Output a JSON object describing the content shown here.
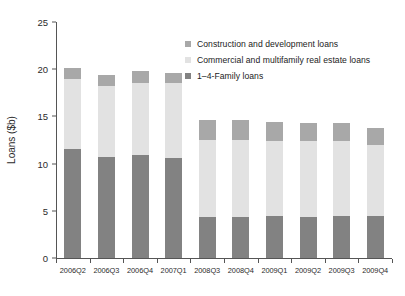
{
  "chart_data": {
    "type": "bar",
    "subtype": "stacked-vertical",
    "title": "",
    "xlabel": "",
    "ylabel": "Loans ($b)",
    "ylim": [
      0,
      25
    ],
    "yticks": [
      0,
      5,
      10,
      15,
      20,
      25
    ],
    "ytick_labels": [
      "0",
      "5",
      "10",
      "15",
      "20",
      "25"
    ],
    "grid": false,
    "legend_position": "upper-right-inside",
    "categories": [
      "2006Q2",
      "2006Q3",
      "2006Q4",
      "2007Q1",
      "2008Q3",
      "2008Q4",
      "2009Q1",
      "2009Q2",
      "2009Q3",
      "2009Q4"
    ],
    "series": [
      {
        "name": "1–4-Family loans",
        "color": "#828282",
        "values": [
          11.5,
          10.7,
          10.9,
          10.6,
          4.3,
          4.3,
          4.4,
          4.3,
          4.4,
          4.4
        ]
      },
      {
        "name": "Commercial and multifamily real estate loans",
        "color": "#e2e2e2",
        "values": [
          7.5,
          7.5,
          7.6,
          7.9,
          8.2,
          8.2,
          8.0,
          8.1,
          8.0,
          7.6
        ]
      },
      {
        "name": "Construction and development loans",
        "color": "#a8a8a8",
        "values": [
          1.1,
          1.2,
          1.3,
          1.1,
          2.1,
          2.1,
          2.0,
          1.9,
          1.9,
          1.8
        ]
      }
    ],
    "totals": [
      20.1,
      19.4,
      19.8,
      19.6,
      14.6,
      14.6,
      14.4,
      14.3,
      14.3,
      13.8
    ]
  },
  "legend": {
    "entries": [
      {
        "label": "Construction and development loans",
        "color": "#a8a8a8"
      },
      {
        "label": "Commercial and multifamily real estate loans",
        "color": "#e2e2e2"
      },
      {
        "label": "1–4-Family loans",
        "color": "#828282"
      }
    ]
  },
  "axes": {
    "y_title": "Loans ($b)",
    "y_tick_labels": [
      "25",
      "20",
      "15",
      "10",
      "5",
      "0"
    ],
    "x_tick_labels": [
      "2006Q2",
      "2006Q3",
      "2006Q4",
      "2007Q1",
      "2008Q3",
      "2008Q4",
      "2009Q1",
      "2009Q2",
      "2009Q3",
      "2009Q4"
    ]
  },
  "colors": {
    "axis": "#555555",
    "text": "#2b2b2b",
    "background": "#ffffff",
    "series_construction": "#a8a8a8",
    "series_commercial": "#e2e2e2",
    "series_family": "#828282"
  }
}
